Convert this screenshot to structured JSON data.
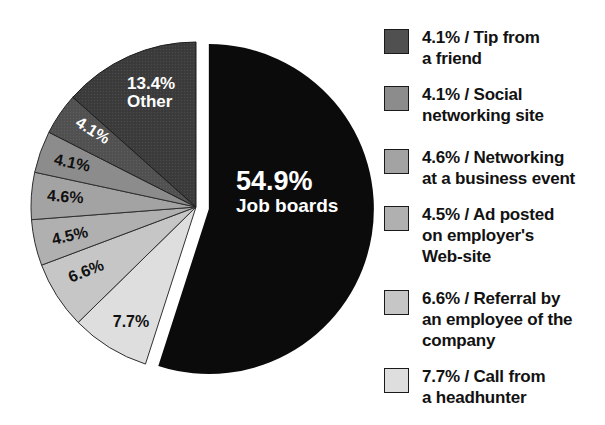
{
  "figure": {
    "width": 605,
    "height": 425,
    "background": "#ffffff"
  },
  "chart_data": {
    "type": "pie",
    "title": "",
    "unit": "%",
    "start_angle_deg": 0,
    "direction": "clockwise",
    "grid": false,
    "legend_position": "right",
    "center": {
      "x": 196,
      "y": 207
    },
    "radius": 165,
    "slices": [
      {
        "id": "job-boards",
        "label": "Job boards",
        "value": 54.9,
        "color": "#0b0b0b",
        "stroke": "none",
        "explode": 13,
        "text_label": {
          "x": 236,
          "y": 190,
          "rotate": 0,
          "anchor": "start",
          "color": "#ffffff",
          "lines": [
            {
              "text": "54.9%",
              "size": 27,
              "dy": 0
            },
            {
              "text": "Job boards",
              "size": 19,
              "dy": 22
            }
          ]
        }
      },
      {
        "id": "headhunter",
        "label": "Call from a headhunter",
        "value": 7.7,
        "color": "#dedede",
        "stroke": "#2f2f2f",
        "explode": 0,
        "text_label": {
          "x": 131,
          "y": 327,
          "rotate": 0,
          "anchor": "middle",
          "color": "#101010",
          "lines": [
            {
              "text": "7.7%",
              "size": 16,
              "dy": 0
            }
          ]
        }
      },
      {
        "id": "referral",
        "label": "Referral by an employee of the company",
        "value": 6.6,
        "color": "#c6c6c6",
        "stroke": "#2f2f2f",
        "explode": 0,
        "text_label": {
          "x": 88,
          "y": 276,
          "rotate": -22,
          "anchor": "middle",
          "color": "#101010",
          "lines": [
            {
              "text": "6.6%",
              "size": 16,
              "dy": 0
            }
          ]
        }
      },
      {
        "id": "ad-posted",
        "label": "Ad posted on employer's Web-site",
        "value": 4.5,
        "color": "#b0b0b0",
        "stroke": "#2f2f2f",
        "explode": 0,
        "text_label": {
          "x": 71,
          "y": 241,
          "rotate": -13,
          "anchor": "middle",
          "color": "#101010",
          "lines": [
            {
              "text": "4.5%",
              "size": 16,
              "dy": 0
            }
          ]
        }
      },
      {
        "id": "networking-event",
        "label": "Networking at a business event",
        "value": 4.6,
        "color": "#a3a3a3",
        "stroke": "#2f2f2f",
        "explode": 0,
        "text_label": {
          "x": 65,
          "y": 202,
          "rotate": 4,
          "anchor": "middle",
          "color": "#101010",
          "lines": [
            {
              "text": "4.6%",
              "size": 16,
              "dy": 0
            }
          ]
        }
      },
      {
        "id": "social-networking",
        "label": "Social networking site",
        "value": 4.1,
        "color": "#8c8c8c",
        "stroke": "#2f2f2f",
        "explode": 0,
        "text_label": {
          "x": 71,
          "y": 168,
          "rotate": 12,
          "anchor": "middle",
          "color": "#101010",
          "lines": [
            {
              "text": "4.1%",
              "size": 16,
              "dy": 0
            }
          ]
        }
      },
      {
        "id": "tip-friend",
        "label": "Tip from a friend",
        "value": 4.1,
        "color": "#505050",
        "dot_color": "#5e5e5e",
        "stroke": "#222222",
        "explode": 0,
        "text_label": {
          "x": 90,
          "y": 135,
          "rotate": 32,
          "anchor": "middle",
          "color": "#ffffff",
          "lines": [
            {
              "text": "4.1%",
              "size": 16,
              "dy": 0
            }
          ]
        }
      },
      {
        "id": "other",
        "label": "Other",
        "value": 13.4,
        "color": "#3a3a3a",
        "dot_color": "#4b4b4b",
        "stroke": "#1d1d1d",
        "explode": 0,
        "text_label": {
          "x": 127,
          "y": 89,
          "rotate": 0,
          "anchor": "start",
          "color": "#ffffff",
          "lines": [
            {
              "text": "13.4%",
              "size": 17,
              "dy": 0
            },
            {
              "text": "Other",
              "size": 17,
              "dy": 18
            }
          ]
        }
      }
    ],
    "legend": {
      "items": [
        {
          "value": 4.1,
          "label": "Tip from a friend",
          "color": "#505050",
          "top": 27,
          "lines": [
            "4.1% / Tip from",
            "a friend"
          ]
        },
        {
          "value": 4.1,
          "label": "Social networking site",
          "color": "#8c8c8c",
          "top": 84,
          "lines": [
            "4.1% / Social",
            "networking site"
          ]
        },
        {
          "value": 4.6,
          "label": "Networking at a business event",
          "color": "#a3a3a3",
          "top": 147,
          "lines": [
            "4.6% / Networking",
            "at a business event"
          ]
        },
        {
          "value": 4.5,
          "label": "Ad posted on employer's Web-site",
          "color": "#b0b0b0",
          "top": 204,
          "lines": [
            "4.5% / Ad posted",
            "on employer's",
            "Web-site"
          ]
        },
        {
          "value": 6.6,
          "label": "Referral by an employee of the company",
          "color": "#c6c6c6",
          "top": 288,
          "lines": [
            "6.6% / Referral by",
            "an employee of the",
            "company"
          ]
        },
        {
          "value": 7.7,
          "label": "Call from a headhunter",
          "color": "#dedede",
          "top": 366,
          "lines": [
            "7.7% / Call from",
            "a headhunter"
          ]
        }
      ]
    }
  }
}
